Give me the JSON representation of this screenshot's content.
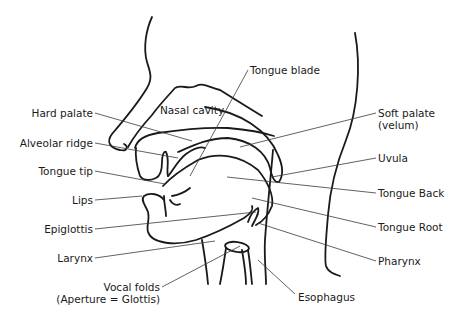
{
  "diagram": {
    "type": "anatomical-illustration",
    "colors": {
      "line": "#1a1a1a",
      "leader": "#3a3a3a",
      "background": "#ffffff"
    },
    "labels": {
      "hard_palate": "Hard palate",
      "alveolar_ridge": "Alveolar ridge",
      "tongue_tip": "Tongue tip",
      "lips": "Lips",
      "epiglottis": "Epiglottis",
      "larynx": "Larynx",
      "vocal_folds_1": "Vocal folds",
      "vocal_folds_2": "(Aperture = Glottis)",
      "nasal_cavity": "Nasal cavity",
      "tongue_blade": "Tongue blade",
      "soft_palate_1": "Soft palate",
      "soft_palate_2": "(velum)",
      "uvula": "Uvula",
      "tongue_back": "Tongue Back",
      "tongue_root": "Tongue Root",
      "pharynx": "Pharynx",
      "esophagus": "Esophagus"
    }
  }
}
